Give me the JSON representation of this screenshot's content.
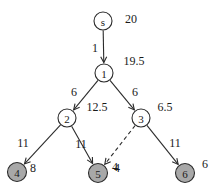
{
  "chart_data": {
    "type": "diagram",
    "diagram_kind": "directed-graph-shortest-path-tree",
    "title": "",
    "nodes": [
      {
        "id": "s",
        "label": "s",
        "value": "20",
        "x": 103,
        "y": 21,
        "r": 9,
        "fill": "white",
        "value_dx": 28,
        "value_dy": -2
      },
      {
        "id": "1",
        "label": "1",
        "value": "19.5",
        "x": 104,
        "y": 73,
        "r": 9,
        "fill": "white",
        "value_dx": 30,
        "value_dy": -12
      },
      {
        "id": "2",
        "label": "2",
        "value": "12.5",
        "x": 67,
        "y": 118,
        "r": 9,
        "fill": "white",
        "value_dx": 30,
        "value_dy": -11
      },
      {
        "id": "3",
        "label": "3",
        "value": "6.5",
        "x": 141,
        "y": 118,
        "r": 9,
        "fill": "white",
        "value_dx": 24,
        "value_dy": -11
      },
      {
        "id": "4",
        "label": "4",
        "value": "8",
        "x": 17,
        "y": 172,
        "r": 9.5,
        "fill": "gray",
        "value_dx": 16,
        "value_dy": -4
      },
      {
        "id": "5",
        "label": "5",
        "value": "4",
        "x": 98,
        "y": 173,
        "r": 9.5,
        "fill": "gray",
        "value_dx": 17,
        "value_dy": -6
      },
      {
        "id": "6",
        "label": "6",
        "value": "6",
        "x": 185,
        "y": 173,
        "r": 9.5,
        "fill": "gray",
        "value_dx": 20,
        "value_dy": -9
      }
    ],
    "edges": [
      {
        "from": "s",
        "to": "1",
        "weight": "1",
        "style": "solid",
        "label_x": 95,
        "label_y": 48
      },
      {
        "from": "1",
        "to": "2",
        "weight": "6",
        "style": "solid",
        "label_x": 74,
        "label_y": 92
      },
      {
        "from": "1",
        "to": "3",
        "weight": "6",
        "style": "solid",
        "label_x": 135,
        "label_y": 92
      },
      {
        "from": "2",
        "to": "4",
        "weight": "11",
        "style": "solid",
        "label_x": 23,
        "label_y": 143
      },
      {
        "from": "2",
        "to": "5",
        "weight": "11",
        "style": "solid",
        "label_x": 81,
        "label_y": 144
      },
      {
        "from": "3",
        "to": "5",
        "weight": "4",
        "style": "dashed",
        "label_x": 117,
        "label_y": 168
      },
      {
        "from": "3",
        "to": "6",
        "weight": "11",
        "style": "solid",
        "label_x": 175,
        "label_y": 143
      }
    ],
    "legend": []
  }
}
